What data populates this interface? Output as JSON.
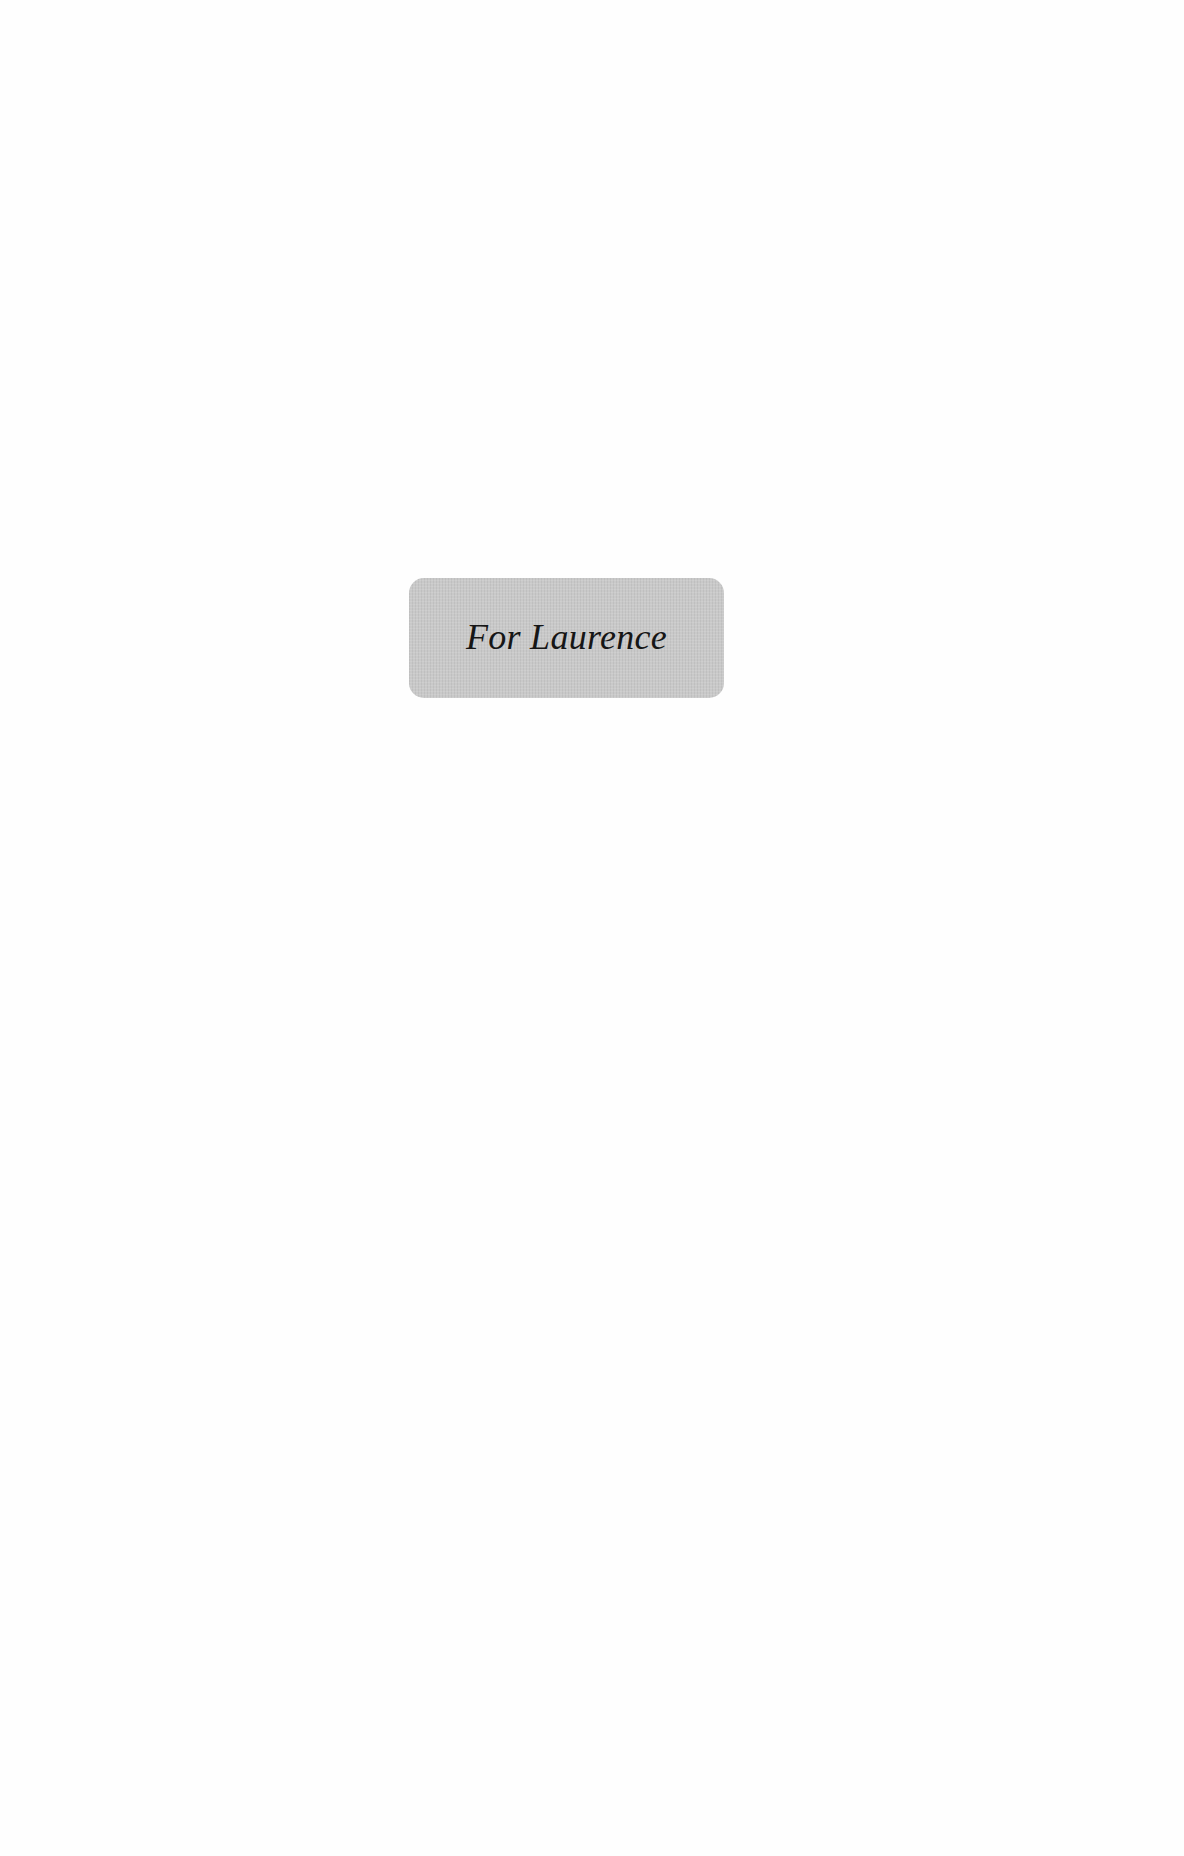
{
  "page": {
    "background": "#fefefe"
  },
  "dedication": {
    "text": "For Laurence",
    "box_color": "#c9c9c9",
    "text_color": "#161616"
  }
}
